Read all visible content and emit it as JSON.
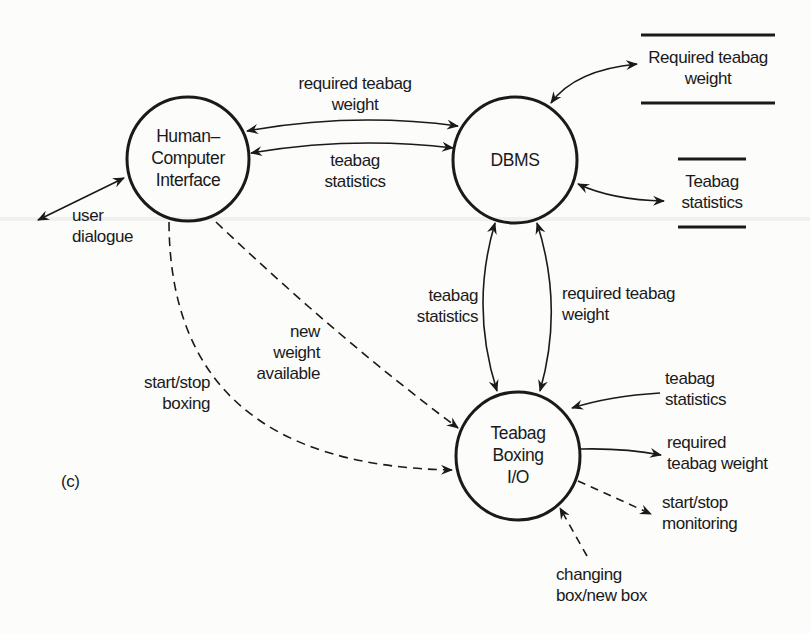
{
  "figure": {
    "panel_label": "(c)",
    "colors": {
      "ink": "#1a1a1a",
      "background": "#fcfcfb"
    }
  },
  "processes": [
    {
      "id": "hci",
      "lines": [
        "Human–",
        "Computer",
        "Interface"
      ]
    },
    {
      "id": "dbms",
      "lines": [
        "DBMS"
      ]
    },
    {
      "id": "boxing_io",
      "lines": [
        "Teabag",
        "Boxing",
        "I/O"
      ]
    }
  ],
  "data_stores": [
    {
      "id": "required_weight_store",
      "lines": [
        "Required teabag",
        "weight"
      ]
    },
    {
      "id": "statistics_store",
      "lines": [
        "Teabag",
        "statistics"
      ]
    }
  ],
  "flows": [
    {
      "id": "user_dialogue",
      "style": "solid",
      "direction": "bidirectional",
      "lines": [
        "user",
        "dialogue"
      ]
    },
    {
      "id": "hci_dbms_required_weight",
      "style": "solid",
      "direction": "bidirectional",
      "lines": [
        "required teabag",
        "weight"
      ]
    },
    {
      "id": "hci_dbms_statistics",
      "style": "solid",
      "direction": "bidirectional",
      "lines": [
        "teabag",
        "statistics"
      ]
    },
    {
      "id": "dbms_boxing_statistics",
      "style": "solid",
      "direction": "bidirectional",
      "lines": [
        "teabag",
        "statistics"
      ]
    },
    {
      "id": "dbms_boxing_required_weight",
      "style": "solid",
      "direction": "bidirectional",
      "lines": [
        "required teabag",
        "weight"
      ]
    },
    {
      "id": "new_weight_available",
      "style": "dashed",
      "direction": "to_boxing",
      "lines": [
        "new",
        "weight",
        "available"
      ]
    },
    {
      "id": "start_stop_boxing",
      "style": "dashed",
      "direction": "to_boxing",
      "lines": [
        "start/stop",
        "boxing"
      ]
    },
    {
      "id": "boxing_in_statistics",
      "style": "solid",
      "direction": "in",
      "lines": [
        "teabag",
        "statistics"
      ]
    },
    {
      "id": "boxing_out_required_weight",
      "style": "solid",
      "direction": "out",
      "lines": [
        "required",
        "teabag weight"
      ]
    },
    {
      "id": "start_stop_monitoring",
      "style": "dashed",
      "direction": "out",
      "lines": [
        "start/stop",
        "monitoring"
      ]
    },
    {
      "id": "changing_box",
      "style": "dashed",
      "direction": "in",
      "lines": [
        "changing",
        "box/new box"
      ]
    }
  ]
}
